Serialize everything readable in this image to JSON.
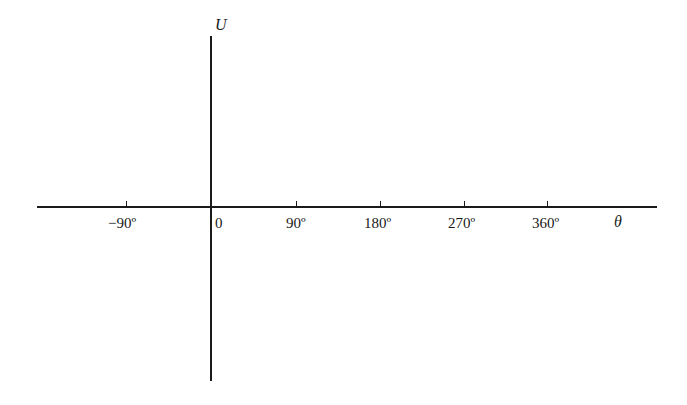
{
  "figure": {
    "y_axis_label": "U",
    "x_axis_label": "θ",
    "origin_label": "0",
    "ticks": [
      {
        "label": "−90º",
        "x": 116
      },
      {
        "label": "90º",
        "x": 296
      },
      {
        "label": "180º",
        "x": 381
      },
      {
        "label": "270º",
        "x": 465
      },
      {
        "label": "360º",
        "x": 548
      }
    ],
    "colors": {
      "line": "#1a1a1a",
      "background": "#ffffff"
    }
  }
}
